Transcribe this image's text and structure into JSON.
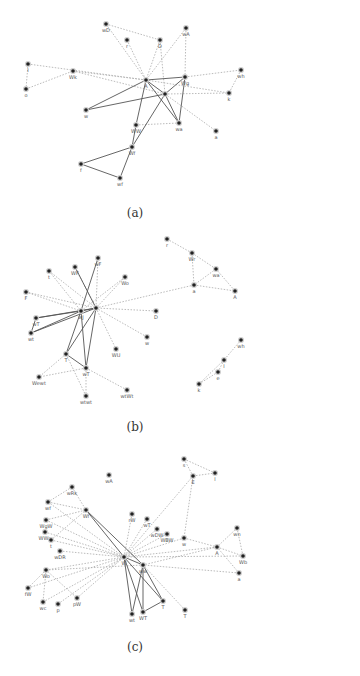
{
  "figure": {
    "panels": [
      {
        "id": "a",
        "caption": "(a)",
        "caption_pos": [
          135,
          218
        ],
        "nodes": [
          {
            "id": "wD",
            "label": "wD",
            "x": 106,
            "y": 24
          },
          {
            "id": "r",
            "label": "r",
            "x": 127,
            "y": 40
          },
          {
            "id": "D",
            "label": "D",
            "x": 160,
            "y": 40
          },
          {
            "id": "wA",
            "label": "wA",
            "x": 186,
            "y": 28
          },
          {
            "id": "I",
            "label": "I",
            "x": 28,
            "y": 64
          },
          {
            "id": "o",
            "label": "o",
            "x": 26,
            "y": 89
          },
          {
            "id": "Wk",
            "label": "Wk",
            "x": 73,
            "y": 71
          },
          {
            "id": "A",
            "label": "A",
            "x": 146,
            "y": 80
          },
          {
            "id": "Wg",
            "label": "Wg",
            "x": 185,
            "y": 77
          },
          {
            "id": "wh",
            "label": "wh",
            "x": 241,
            "y": 70
          },
          {
            "id": "k",
            "label": "k",
            "x": 229,
            "y": 93
          },
          {
            "id": "X",
            "label": "",
            "x": 165,
            "y": 94
          },
          {
            "id": "w",
            "label": "w",
            "x": 86,
            "y": 110
          },
          {
            "id": "WW",
            "label": "WW",
            "x": 136,
            "y": 125
          },
          {
            "id": "wa",
            "label": "wa",
            "x": 179,
            "y": 123
          },
          {
            "id": "a",
            "label": "a",
            "x": 216,
            "y": 131
          },
          {
            "id": "Wf",
            "label": "Wf",
            "x": 132,
            "y": 147
          },
          {
            "id": "f",
            "label": "f",
            "x": 81,
            "y": 164
          },
          {
            "id": "wf",
            "label": "wf",
            "x": 120,
            "y": 178
          }
        ],
        "edges_solid": [
          [
            "A",
            "Wg"
          ],
          [
            "A",
            "X"
          ],
          [
            "A",
            "w"
          ],
          [
            "A",
            "WW"
          ],
          [
            "A",
            "wa"
          ],
          [
            "X",
            "Wg"
          ],
          [
            "X",
            "w"
          ],
          [
            "X",
            "wa"
          ],
          [
            "X",
            "Wf"
          ],
          [
            "Wg",
            "wa"
          ],
          [
            "Wf",
            "f"
          ],
          [
            "Wf",
            "wf"
          ],
          [
            "f",
            "wf"
          ],
          [
            "WW",
            "Wf"
          ]
        ],
        "edges_dotted": [
          [
            "wD",
            "D"
          ],
          [
            "wD",
            "A"
          ],
          [
            "r",
            "A"
          ],
          [
            "D",
            "A"
          ],
          [
            "D",
            "X"
          ],
          [
            "wA",
            "A"
          ],
          [
            "wA",
            "Wg"
          ],
          [
            "I",
            "o"
          ],
          [
            "I",
            "A"
          ],
          [
            "o",
            "Wk"
          ],
          [
            "Wk",
            "A"
          ],
          [
            "Wk",
            "X"
          ],
          [
            "Wg",
            "wh"
          ],
          [
            "wh",
            "k"
          ],
          [
            "X",
            "k"
          ],
          [
            "A",
            "k"
          ],
          [
            "X",
            "a"
          ],
          [
            "WW",
            "wa"
          ]
        ]
      },
      {
        "id": "b",
        "caption": "(b)",
        "caption_pos": [
          135,
          432
        ],
        "nodes": [
          {
            "id": "r",
            "label": "r",
            "x": 167,
            "y": 239
          },
          {
            "id": "Wr",
            "label": "Wr",
            "x": 192,
            "y": 253
          },
          {
            "id": "wa",
            "label": "wa",
            "x": 216,
            "y": 269
          },
          {
            "id": "a",
            "label": "a",
            "x": 194,
            "y": 285
          },
          {
            "id": "A",
            "label": "A",
            "x": 235,
            "y": 291
          },
          {
            "id": "wF",
            "label": "wF",
            "x": 98,
            "y": 258
          },
          {
            "id": "WF",
            "label": "WF",
            "x": 75,
            "y": 267
          },
          {
            "id": "t",
            "label": "t",
            "x": 49,
            "y": 271
          },
          {
            "id": "Wo",
            "label": "Wo",
            "x": 125,
            "y": 277
          },
          {
            "id": "F",
            "label": "F",
            "x": 26,
            "y": 292
          },
          {
            "id": "hub1",
            "label": "wJ",
            "x": 81,
            "y": 311
          },
          {
            "id": "hub2",
            "label": "",
            "x": 96,
            "y": 308
          },
          {
            "id": "D",
            "label": "D",
            "x": 156,
            "y": 311
          },
          {
            "id": "wT",
            "label": "wT",
            "x": 36,
            "y": 318
          },
          {
            "id": "wt",
            "label": "wt",
            "x": 31,
            "y": 333
          },
          {
            "id": "w",
            "label": "w",
            "x": 147,
            "y": 337
          },
          {
            "id": "WU",
            "label": "WU",
            "x": 116,
            "y": 349
          },
          {
            "id": "T",
            "label": "T",
            "x": 66,
            "y": 354
          },
          {
            "id": "WT",
            "label": "wT",
            "x": 86,
            "y": 368
          },
          {
            "id": "Wewt",
            "label": "Wewt",
            "x": 39,
            "y": 377
          },
          {
            "id": "wtWt",
            "label": "wtWt",
            "x": 127,
            "y": 390
          },
          {
            "id": "wtwt",
            "label": "wtwt",
            "x": 86,
            "y": 396
          },
          {
            "id": "wh",
            "label": "wh",
            "x": 241,
            "y": 340
          },
          {
            "id": "l",
            "label": "l",
            "x": 224,
            "y": 360
          },
          {
            "id": "e",
            "label": "e",
            "x": 218,
            "y": 372
          },
          {
            "id": "k",
            "label": "k",
            "x": 199,
            "y": 384
          }
        ],
        "edges_solid": [
          [
            "hub1",
            "hub2"
          ],
          [
            "hub1",
            "wT"
          ],
          [
            "hub1",
            "wt"
          ],
          [
            "hub1",
            "T"
          ],
          [
            "hub1",
            "WT"
          ],
          [
            "hub2",
            "wT"
          ],
          [
            "hub2",
            "wt"
          ],
          [
            "hub2",
            "T"
          ],
          [
            "hub2",
            "WT"
          ],
          [
            "T",
            "WT"
          ],
          [
            "wT",
            "wt"
          ],
          [
            "hub2",
            "WF"
          ],
          [
            "hub1",
            "wF"
          ]
        ],
        "edges_dotted": [
          [
            "r",
            "Wr"
          ],
          [
            "Wr",
            "wa"
          ],
          [
            "Wr",
            "a"
          ],
          [
            "wa",
            "a"
          ],
          [
            "wa",
            "A"
          ],
          [
            "a",
            "A"
          ],
          [
            "a",
            "hub2"
          ],
          [
            "t",
            "hub1"
          ],
          [
            "t",
            "hub2"
          ],
          [
            "F",
            "hub1"
          ],
          [
            "F",
            "hub2"
          ],
          [
            "Wo",
            "hub2"
          ],
          [
            "Wo",
            "hub1"
          ],
          [
            "D",
            "hub2"
          ],
          [
            "hub2",
            "w"
          ],
          [
            "hub2",
            "WU"
          ],
          [
            "T",
            "Wewt"
          ],
          [
            "WT",
            "Wewt"
          ],
          [
            "WT",
            "wtWt"
          ],
          [
            "WT",
            "wtwt"
          ],
          [
            "T",
            "wtwt"
          ],
          [
            "wh",
            "l"
          ],
          [
            "l",
            "e"
          ],
          [
            "e",
            "k"
          ],
          [
            "l",
            "k"
          ],
          [
            "WF",
            "hub2"
          ],
          [
            "wF",
            "hub2"
          ]
        ]
      },
      {
        "id": "c",
        "caption": "(c)",
        "caption_pos": [
          135,
          651
        ],
        "nodes": [
          {
            "id": "s",
            "label": "s",
            "x": 184,
            "y": 459
          },
          {
            "id": "E",
            "label": "E",
            "x": 193,
            "y": 476
          },
          {
            "id": "l",
            "label": "l",
            "x": 215,
            "y": 473
          },
          {
            "id": "wA",
            "label": "wA",
            "x": 109,
            "y": 475
          },
          {
            "id": "wRk",
            "label": "wRk",
            "x": 72,
            "y": 487
          },
          {
            "id": "wf",
            "label": "wf",
            "x": 48,
            "y": 502
          },
          {
            "id": "Wf",
            "label": "Wf",
            "x": 86,
            "y": 510
          },
          {
            "id": "rW",
            "label": "rW",
            "x": 132,
            "y": 514
          },
          {
            "id": "wT",
            "label": "wT",
            "x": 147,
            "y": 519
          },
          {
            "id": "WgW",
            "label": "WgW",
            "x": 46,
            "y": 520
          },
          {
            "id": "wDW",
            "label": "wDW",
            "x": 157,
            "y": 529
          },
          {
            "id": "WBW",
            "label": "WBW",
            "x": 167,
            "y": 534
          },
          {
            "id": "w",
            "label": "w",
            "x": 184,
            "y": 538
          },
          {
            "id": "wn",
            "label": "wn",
            "x": 237,
            "y": 528
          },
          {
            "id": "WWg",
            "label": "WWg",
            "x": 45,
            "y": 532
          },
          {
            "id": "t",
            "label": "t",
            "x": 51,
            "y": 540
          },
          {
            "id": "A",
            "label": "A",
            "x": 217,
            "y": 547
          },
          {
            "id": "wDR",
            "label": "wDR",
            "x": 60,
            "y": 551
          },
          {
            "id": "Wb",
            "label": "Wb",
            "x": 243,
            "y": 556
          },
          {
            "id": "hubW",
            "label": "W",
            "x": 124,
            "y": 557
          },
          {
            "id": "hubww",
            "label": "ww",
            "x": 143,
            "y": 565
          },
          {
            "id": "a",
            "label": "a",
            "x": 239,
            "y": 573
          },
          {
            "id": "Wo",
            "label": "Wo",
            "x": 46,
            "y": 570
          },
          {
            "id": "fW",
            "label": "fW",
            "x": 28,
            "y": 588
          },
          {
            "id": "wc",
            "label": "wc",
            "x": 43,
            "y": 602
          },
          {
            "id": "p",
            "label": "p",
            "x": 58,
            "y": 604
          },
          {
            "id": "pW",
            "label": "pW",
            "x": 77,
            "y": 598
          },
          {
            "id": "T1",
            "label": "T",
            "x": 163,
            "y": 601
          },
          {
            "id": "T2",
            "label": "T",
            "x": 185,
            "y": 610
          },
          {
            "id": "wt",
            "label": "wt",
            "x": 132,
            "y": 614
          },
          {
            "id": "WT",
            "label": "WT",
            "x": 143,
            "y": 612
          }
        ],
        "edges_solid": [
          [
            "Wf",
            "hubW"
          ],
          [
            "Wf",
            "hubww"
          ],
          [
            "hubW",
            "hubww"
          ],
          [
            "hubW",
            "wt"
          ],
          [
            "hubW",
            "WT"
          ],
          [
            "hubww",
            "wt"
          ],
          [
            "hubww",
            "WT"
          ],
          [
            "hubww",
            "T1"
          ],
          [
            "WT",
            "T1"
          ],
          [
            "hubW",
            "T1"
          ]
        ],
        "edges_dotted": [
          [
            "s",
            "E"
          ],
          [
            "s",
            "l"
          ],
          [
            "E",
            "l"
          ],
          [
            "E",
            "hubW"
          ],
          [
            "E",
            "w"
          ],
          [
            "wRk",
            "wf"
          ],
          [
            "wRk",
            "Wf"
          ],
          [
            "wf",
            "Wf"
          ],
          [
            "wf",
            "hubW"
          ],
          [
            "WgW",
            "hubW"
          ],
          [
            "WgW",
            "Wf"
          ],
          [
            "WWg",
            "hubW"
          ],
          [
            "t",
            "hubW"
          ],
          [
            "t",
            "Wf"
          ],
          [
            "wDR",
            "hubW"
          ],
          [
            "Wo",
            "hubW"
          ],
          [
            "Wo",
            "hubww"
          ],
          [
            "Wo",
            "fW"
          ],
          [
            "Wo",
            "wc"
          ],
          [
            "Wo",
            "pW"
          ],
          [
            "fW",
            "hubW"
          ],
          [
            "wc",
            "hubW"
          ],
          [
            "p",
            "hubW"
          ],
          [
            "pW",
            "hubW"
          ],
          [
            "rW",
            "hubW"
          ],
          [
            "wT",
            "hubW"
          ],
          [
            "wDW",
            "hubW"
          ],
          [
            "WBW",
            "hubW"
          ],
          [
            "w",
            "hubW"
          ],
          [
            "w",
            "A"
          ],
          [
            "wn",
            "A"
          ],
          [
            "wn",
            "Wb"
          ],
          [
            "A",
            "hubW"
          ],
          [
            "A",
            "hubww"
          ],
          [
            "A",
            "Wb"
          ],
          [
            "a",
            "A"
          ],
          [
            "a",
            "hubww"
          ],
          [
            "hubww",
            "T2"
          ],
          [
            "Wb",
            "hubW"
          ]
        ]
      }
    ]
  }
}
